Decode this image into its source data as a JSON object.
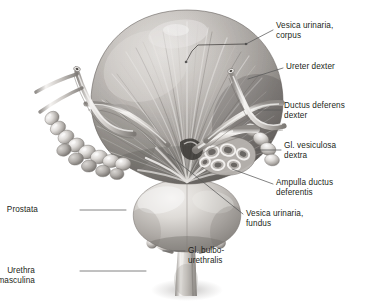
{
  "figure": {
    "background_color": "#ffffff",
    "ink_color": "#231f20",
    "leader_color": "#5a5a5a",
    "style": "grayscale medical illustration"
  },
  "labels": [
    {
      "id": "vesica-urinaria-corpus",
      "lines": [
        "Vesica urinaria,",
        "corpus"
      ],
      "side": "right",
      "x": 276,
      "y": 21,
      "leader": [
        [
          273,
          30
        ],
        [
          246,
          44
        ]
      ]
    },
    {
      "id": "ureter-dexter",
      "lines": [
        "Ureter dexter"
      ],
      "side": "right",
      "x": 286,
      "y": 62,
      "leader": [
        [
          283,
          68
        ],
        [
          248,
          79
        ]
      ]
    },
    {
      "id": "ductus-deferens-dexter",
      "lines": [
        "Ductus deferens",
        "dexter"
      ],
      "side": "right",
      "x": 284,
      "y": 101,
      "leader": [
        [
          281,
          110
        ],
        [
          258,
          110
        ]
      ]
    },
    {
      "id": "gl-vesiculosa-dextra",
      "lines": [
        "Gl. vesiculosa",
        "dextra"
      ],
      "side": "right",
      "x": 284,
      "y": 141,
      "leader": [
        [
          281,
          150
        ],
        [
          256,
          150
        ]
      ]
    },
    {
      "id": "ampulla-ductus-deferentis",
      "lines": [
        "Ampulla ductus",
        "deferentis"
      ],
      "side": "right",
      "x": 276,
      "y": 178,
      "leader": [
        [
          273,
          184
        ],
        [
          232,
          169
        ]
      ]
    },
    {
      "id": "vesica-urinaria-fundus",
      "lines": [
        "Vesica urinaria,",
        "fundus"
      ],
      "side": "right",
      "x": 246,
      "y": 209,
      "leader": [
        [
          243,
          214
        ],
        [
          168,
          154
        ]
      ]
    },
    {
      "id": "prostata",
      "lines": [
        "Prostata"
      ],
      "side": "left",
      "x": 38,
      "y": 205,
      "leader": [
        [
          80,
          210
        ],
        [
          126,
          210
        ]
      ]
    },
    {
      "id": "gl-bulbourethralis",
      "lines": [
        "Gl. bulbo-",
        "urethralis"
      ],
      "side": "right",
      "x": 188,
      "y": 246,
      "leader": [
        [
          185,
          251
        ],
        [
          163,
          251
        ]
      ]
    },
    {
      "id": "urethra-masculina",
      "lines": [
        "Urethra",
        "masculina"
      ],
      "side": "left",
      "x": 35,
      "y": 266,
      "leader": [
        [
          80,
          271
        ],
        [
          146,
          271
        ]
      ]
    }
  ],
  "internal_leaders": [
    {
      "id": "corpus-bracket",
      "points": [
        [
          246,
          44
        ],
        [
          198,
          45
        ],
        [
          192,
          51
        ],
        [
          186,
          62
        ]
      ],
      "note": "bracket marker over bladder body musculature"
    }
  ],
  "structures": [
    {
      "id": "bladder-body",
      "name": "Vesica urinaria, corpus"
    },
    {
      "id": "ureter-right",
      "name": "Ureter dexter"
    },
    {
      "id": "ureter-left",
      "name": "Ureter sinister"
    },
    {
      "id": "ductus-deferens-right",
      "name": "Ductus deferens dexter"
    },
    {
      "id": "ductus-deferens-left",
      "name": "Ductus deferens sinister"
    },
    {
      "id": "seminal-vesicle-right",
      "name": "Gl. vesiculosa dextra"
    },
    {
      "id": "seminal-vesicle-left",
      "name": "Gl. vesiculosa sinistra"
    },
    {
      "id": "ampulla-right",
      "name": "Ampulla ductus deferentis"
    },
    {
      "id": "bladder-fundus",
      "name": "Vesica urinaria, fundus"
    },
    {
      "id": "prostate",
      "name": "Prostata"
    },
    {
      "id": "bulbourethral-gland-left",
      "name": "Gl. bulbourethralis"
    },
    {
      "id": "bulbourethral-gland-right",
      "name": "Gl. bulbourethralis"
    },
    {
      "id": "urethra",
      "name": "Urethra masculina"
    }
  ]
}
